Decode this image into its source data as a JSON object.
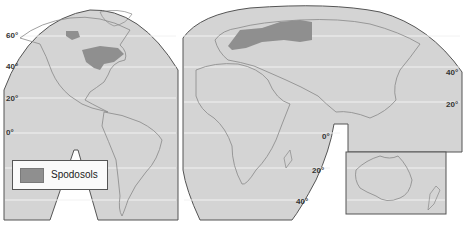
{
  "map": {
    "title": "Spodosols world distribution",
    "colors": {
      "land_background": "#d4d4d4",
      "ocean": "#d8d8d8",
      "spodosols": "#8f8f8f",
      "outline": "#555555",
      "latitude_lines": "#f2f2f2"
    },
    "latitude_labels": {
      "left": [
        "60°",
        "40°",
        "20°",
        "0°"
      ],
      "right_top": [
        "40°",
        "20°"
      ],
      "africa": [
        "0°",
        "20°",
        "40°"
      ]
    },
    "legend": {
      "items": [
        {
          "label": "Spodosols",
          "color": "#8f8f8f"
        }
      ]
    }
  }
}
